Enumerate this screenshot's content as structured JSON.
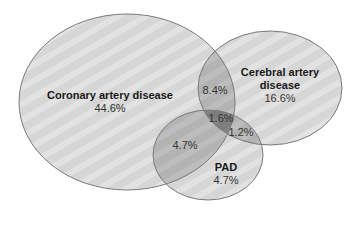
{
  "diagram": {
    "type": "venn",
    "colors": {
      "background": "#ffffff",
      "set_fill": "#d6d6d6",
      "overlap_fill": "#b3b3b3",
      "triple_overlap_fill": "#a3a3a3",
      "outline": "#7a7a7a",
      "stripe": "#e6e6e6"
    },
    "sets": [
      {
        "id": "cad",
        "name": "Coronary artery disease",
        "value": "44.6%",
        "ellipse": {
          "cx": 127,
          "cy": 102,
          "rx": 108,
          "ry": 88
        }
      },
      {
        "id": "cerebral",
        "name_line1": "Cerebral artery",
        "name_line2": "disease",
        "value": "16.6%",
        "ellipse": {
          "cx": 270,
          "cy": 88,
          "rx": 72,
          "ry": 57
        }
      },
      {
        "id": "pad",
        "name": "PAD",
        "value": "4.7%",
        "ellipse": {
          "cx": 208,
          "cy": 155,
          "rx": 55,
          "ry": 45
        }
      }
    ],
    "overlaps": [
      {
        "id": "cad-cerebral",
        "value": "8.4%"
      },
      {
        "id": "cad-pad",
        "value": "4.7%"
      },
      {
        "id": "cerebral-pad",
        "value": "1.2%"
      },
      {
        "id": "cad-cerebral-pad",
        "value": "1.6%"
      }
    ]
  }
}
